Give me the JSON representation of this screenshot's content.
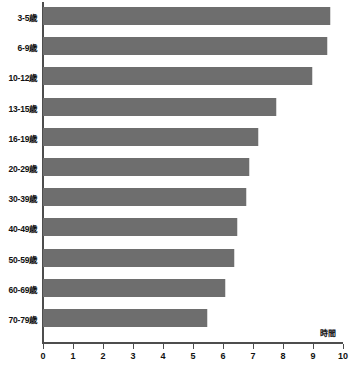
{
  "chart_data": {
    "type": "bar",
    "orientation": "horizontal",
    "title": "",
    "subtitle": "",
    "xlabel": "時間",
    "ylabel": "",
    "categories": [
      "3-5歳",
      "6-9歳",
      "10-12歳",
      "13-15歳",
      "16-19歳",
      "20-29歳",
      "30-39歳",
      "40-49歳",
      "50-59歳",
      "60-69歳",
      "70-79歳"
    ],
    "values": [
      9.6,
      9.5,
      9.0,
      7.8,
      7.2,
      6.9,
      6.8,
      6.5,
      6.4,
      6.1,
      5.5
    ],
    "series": [
      {
        "name": "睡眠時間",
        "values": [
          9.6,
          9.5,
          9.0,
          7.8,
          7.2,
          6.9,
          6.8,
          6.5,
          6.4,
          6.1,
          5.5
        ]
      }
    ],
    "xlim": [
      0,
      10
    ],
    "xticks": [
      0,
      1,
      2,
      3,
      4,
      5,
      6,
      7,
      8,
      9,
      10
    ],
    "xtick_labels": [
      "0",
      "1",
      "2",
      "3",
      "4",
      "5",
      "6",
      "7",
      "8",
      "9",
      "10"
    ],
    "grid": false,
    "legend": false,
    "legend_position": "none",
    "bar_color": "#6e6e6e",
    "axis_color": "#4d4d4d",
    "background_color": "#ffffff",
    "annotations": [
      {
        "text": "時間",
        "position": "above-axis-right"
      }
    ]
  }
}
